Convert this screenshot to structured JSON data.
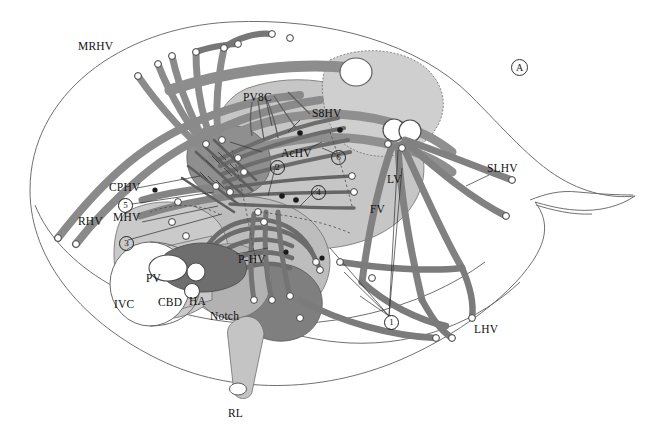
{
  "figure": {
    "panel_marker": "A"
  },
  "labels": [
    {
      "id": "mrhv",
      "text": "MRHV",
      "x": 78,
      "y": 41
    },
    {
      "id": "pv8c",
      "text": "PV8C",
      "x": 243,
      "y": 92
    },
    {
      "id": "s8hv",
      "text": "S8HV",
      "x": 312,
      "y": 108
    },
    {
      "id": "achv",
      "text": "AcHV",
      "x": 281,
      "y": 148
    },
    {
      "id": "slhv",
      "text": "SLHV",
      "x": 487,
      "y": 163
    },
    {
      "id": "lv",
      "text": "LV",
      "x": 387,
      "y": 174
    },
    {
      "id": "cphv",
      "text": "CPHV",
      "x": 109,
      "y": 182
    },
    {
      "id": "fv",
      "text": "FV",
      "x": 370,
      "y": 204
    },
    {
      "id": "rhv",
      "text": "RHV",
      "x": 78,
      "y": 216
    },
    {
      "id": "mhv",
      "text": "MHV",
      "x": 113,
      "y": 212
    },
    {
      "id": "phv",
      "text": "P-HV",
      "x": 238,
      "y": 254
    },
    {
      "id": "pv",
      "text": "PV",
      "x": 146,
      "y": 273
    },
    {
      "id": "cbd",
      "text": "CBD",
      "x": 158,
      "y": 297
    },
    {
      "id": "ha",
      "text": "HA",
      "x": 189,
      "y": 296
    },
    {
      "id": "ivc",
      "text": "IVC",
      "x": 114,
      "y": 299
    },
    {
      "id": "notch",
      "text": "Notch",
      "x": 210,
      "y": 311
    },
    {
      "id": "lhv",
      "text": "LHV",
      "x": 474,
      "y": 324
    },
    {
      "id": "rl",
      "text": "RL",
      "x": 228,
      "y": 408
    }
  ],
  "circled_numbers": [
    {
      "id": "n1",
      "text": "1",
      "x": 384,
      "y": 315
    },
    {
      "id": "n2",
      "text": "2",
      "x": 270,
      "y": 160
    },
    {
      "id": "n3",
      "text": "3",
      "x": 119,
      "y": 236
    },
    {
      "id": "n4",
      "text": "4",
      "x": 311,
      "y": 185
    },
    {
      "id": "n5",
      "text": "5",
      "x": 118,
      "y": 198
    },
    {
      "id": "n6",
      "text": "6",
      "x": 331,
      "y": 150
    }
  ],
  "colors": {
    "outline": "#6b6b6b",
    "liver_light": "#d2d2d2",
    "liver_mid": "#b4b4b4",
    "liver_dark": "#8d8d8d",
    "vessel_gray": "#8a8a8a",
    "vessel_dark": "#6f6f6f",
    "vessel_darkest": "#5a5a5a",
    "white": "#ffffff",
    "stroke": "#4a4a4a",
    "text": "#111111"
  }
}
